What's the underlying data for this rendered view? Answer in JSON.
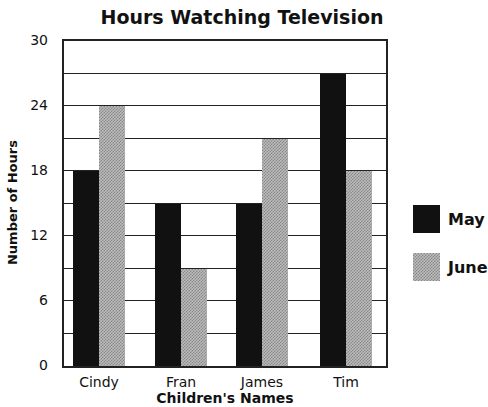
{
  "chart_data": {
    "type": "bar",
    "title": "Hours Watching Television",
    "xlabel": "Children's Names",
    "ylabel": "Number of Hours",
    "categories": [
      "Cindy",
      "Fran",
      "James",
      "Tim"
    ],
    "series": [
      {
        "name": "May",
        "values": [
          18,
          15,
          15,
          27
        ],
        "color": "#111111"
      },
      {
        "name": "June",
        "values": [
          24,
          9,
          21,
          18
        ],
        "color": "#aaaaaa"
      }
    ],
    "ylim": [
      0,
      30
    ],
    "yticks": [
      0,
      6,
      12,
      18,
      24,
      30
    ],
    "grid": true,
    "grid_step": 3,
    "legend_position": "right"
  }
}
